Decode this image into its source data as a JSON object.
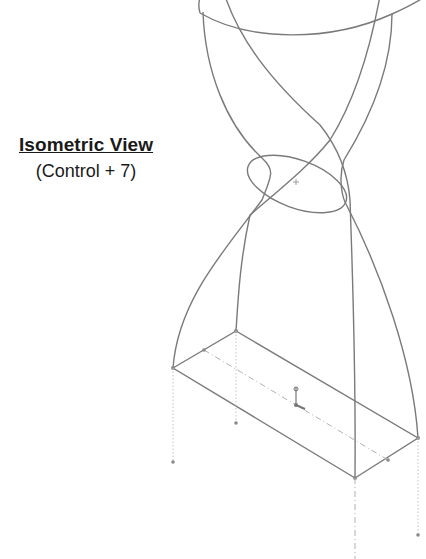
{
  "caption": {
    "title": "Isometric View",
    "shortcut": "(Control + 7)"
  },
  "drawing": {
    "type": "isometric-wireframe",
    "description": "Lofted hourglass-like sketch with top ellipse, middle ellipse and bottom rectangle",
    "colors": {
      "line": "#7a7a7a",
      "construction": "#b0b0b0",
      "background": "#ffffff"
    }
  }
}
